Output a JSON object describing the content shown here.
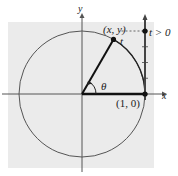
{
  "diagram": {
    "type": "unit-circle-wrapping",
    "axis_labels": {
      "x": "x",
      "y": "y"
    },
    "point_labels": {
      "terminal": "(x, y)",
      "initial": "(1, 0)"
    },
    "arc_label": "t",
    "angle_label": "θ",
    "number_line_label": "t > 0",
    "colors": {
      "background": "#ebebeb",
      "circle": "#555555",
      "axes": "#555555",
      "radius": "#111111",
      "number_line": "#444444",
      "points": "#111111"
    },
    "circle_radius_units": 1,
    "terminal_angle_deg": 60,
    "number_line_t_value": 1.0,
    "number_line_ticks": [
      0,
      0.25,
      0.5,
      0.75,
      1.0
    ]
  }
}
